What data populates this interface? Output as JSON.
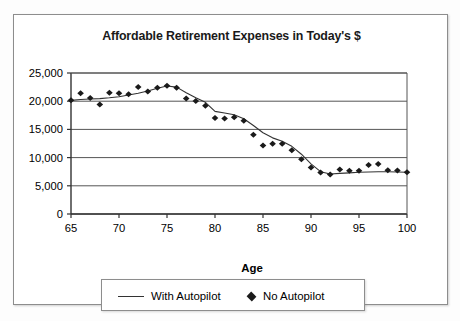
{
  "chart_data": {
    "type": "line",
    "title": "Affordable Retirement Expenses in Today's $",
    "xlabel": "Age",
    "ylabel": "",
    "xlim": [
      65,
      100
    ],
    "ylim": [
      0,
      25000
    ],
    "grid": "horizontal",
    "legend_position": "bottom",
    "xticks": [
      "65",
      "70",
      "75",
      "80",
      "85",
      "90",
      "95",
      "100"
    ],
    "xtick_values": [
      65,
      70,
      75,
      80,
      85,
      90,
      95,
      100
    ],
    "yticks": [
      "0",
      "5,000",
      "10,000",
      "15,000",
      "20,000",
      "25,000"
    ],
    "ytick_values": [
      0,
      5000,
      10000,
      15000,
      20000,
      25000
    ],
    "x": [
      65,
      66,
      67,
      68,
      69,
      70,
      71,
      72,
      73,
      74,
      75,
      76,
      77,
      78,
      79,
      80,
      81,
      82,
      83,
      84,
      85,
      86,
      87,
      88,
      89,
      90,
      91,
      92,
      93,
      94,
      95,
      96,
      97,
      98,
      99,
      100
    ],
    "series": [
      {
        "name": "With Autopilot",
        "style": "line",
        "color": "#333333",
        "values": [
          20150,
          20300,
          20400,
          20450,
          20600,
          20800,
          21100,
          21400,
          21800,
          22300,
          22700,
          22500,
          21500,
          20600,
          19800,
          18200,
          17900,
          17600,
          16900,
          15700,
          14400,
          13500,
          12900,
          12000,
          10600,
          8900,
          7500,
          7100,
          7200,
          7300,
          7400,
          7450,
          7500,
          7500,
          7450,
          7400
        ]
      },
      {
        "name": "No Autopilot",
        "style": "marker",
        "marker": "diamond",
        "color": "#1a1a1a",
        "values": [
          20150,
          21400,
          20550,
          19400,
          21500,
          21400,
          21250,
          22500,
          21700,
          22400,
          22750,
          22400,
          20500,
          20050,
          19200,
          17000,
          16950,
          17150,
          16550,
          14050,
          12150,
          12450,
          12450,
          11300,
          9700,
          8250,
          7350,
          7000,
          7900,
          7650,
          7650,
          8700,
          8850,
          7750,
          7700,
          7400
        ]
      }
    ]
  },
  "legend": {
    "entries": [
      {
        "label": "With Autopilot",
        "marker": "line"
      },
      {
        "label": "No Autopilot",
        "marker": "diamond"
      }
    ]
  },
  "axis": {
    "x_title": "Age"
  }
}
